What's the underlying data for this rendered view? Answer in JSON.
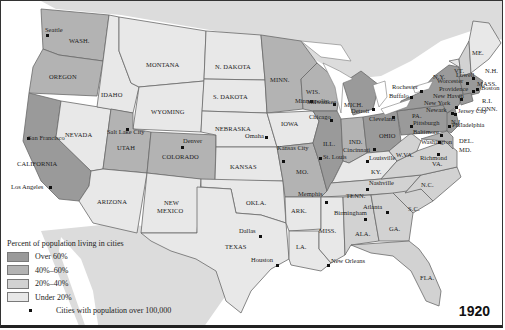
{
  "map": {
    "year": "1920",
    "colors": {
      "over60": "#9a9a9a",
      "40to60": "#b3b3b3",
      "20to40": "#d2d2d2",
      "under20": "#e8e8e8",
      "water": "#ffffff",
      "outside": "#d9d9d9"
    },
    "legend": {
      "title": "Percent of population living in cities",
      "items": [
        {
          "label": "Over 60%",
          "key": "over60"
        },
        {
          "label": "40%–60%",
          "key": "40to60"
        },
        {
          "label": "20%–40%",
          "key": "20to40"
        },
        {
          "label": "Under 20%",
          "key": "under20"
        }
      ],
      "cities_label": "Cities with population over 100,000"
    },
    "states": [
      {
        "name": "WASH.",
        "x": 68,
        "y": 36
      },
      {
        "name": "OREGON",
        "x": 48,
        "y": 72
      },
      {
        "name": "CALIFORNIA",
        "x": 16,
        "y": 159
      },
      {
        "name": "NEVADA",
        "x": 64,
        "y": 130
      },
      {
        "name": "IDAHO",
        "x": 100,
        "y": 90
      },
      {
        "name": "MONTANA",
        "x": 145,
        "y": 60
      },
      {
        "name": "WYOMING",
        "x": 150,
        "y": 107
      },
      {
        "name": "UTAH",
        "x": 116,
        "y": 143
      },
      {
        "name": "COLORADO",
        "x": 161,
        "y": 152
      },
      {
        "name": "ARIZONA",
        "x": 96,
        "y": 197
      },
      {
        "name": "NEW",
        "x": 163,
        "y": 198
      },
      {
        "name": "MEXICO",
        "x": 156,
        "y": 206
      },
      {
        "name": "N. DAKOTA",
        "x": 214,
        "y": 62
      },
      {
        "name": "S. DAKOTA",
        "x": 212,
        "y": 92
      },
      {
        "name": "NEBRASKA",
        "x": 214,
        "y": 124
      },
      {
        "name": "KANSAS",
        "x": 229,
        "y": 162
      },
      {
        "name": "OKLA.",
        "x": 245,
        "y": 198
      },
      {
        "name": "TEXAS",
        "x": 224,
        "y": 242
      },
      {
        "name": "MINN.",
        "x": 269,
        "y": 75
      },
      {
        "name": "IOWA",
        "x": 280,
        "y": 119
      },
      {
        "name": "MO.",
        "x": 295,
        "y": 167
      },
      {
        "name": "ARK.",
        "x": 290,
        "y": 206
      },
      {
        "name": "LA.",
        "x": 295,
        "y": 242
      },
      {
        "name": "WIS.",
        "x": 305,
        "y": 87
      },
      {
        "name": "ILL.",
        "x": 322,
        "y": 139
      },
      {
        "name": "MICH.",
        "x": 343,
        "y": 100
      },
      {
        "name": "IND.",
        "x": 348,
        "y": 137
      },
      {
        "name": "OHIO",
        "x": 378,
        "y": 131
      },
      {
        "name": "KY.",
        "x": 370,
        "y": 167
      },
      {
        "name": "TENN.",
        "x": 345,
        "y": 191
      },
      {
        "name": "MISS.",
        "x": 318,
        "y": 226
      },
      {
        "name": "ALA.",
        "x": 354,
        "y": 229
      },
      {
        "name": "GA.",
        "x": 388,
        "y": 224
      },
      {
        "name": "FLA.",
        "x": 419,
        "y": 273
      },
      {
        "name": "S.C.",
        "x": 407,
        "y": 204
      },
      {
        "name": "N.C.",
        "x": 420,
        "y": 180
      },
      {
        "name": "VA.",
        "x": 431,
        "y": 159
      },
      {
        "name": "W.VA.",
        "x": 395,
        "y": 150
      },
      {
        "name": "MD.",
        "x": 458,
        "y": 145
      },
      {
        "name": "DEL.",
        "x": 458,
        "y": 136
      },
      {
        "name": "PA.",
        "x": 411,
        "y": 111
      },
      {
        "name": "N.J.",
        "x": 450,
        "y": 117
      },
      {
        "name": "N.Y.",
        "x": 432,
        "y": 72
      },
      {
        "name": "VT.",
        "x": 453,
        "y": 66
      },
      {
        "name": "N.H.",
        "x": 484,
        "y": 66
      },
      {
        "name": "ME.",
        "x": 471,
        "y": 48
      },
      {
        "name": "MASS.",
        "x": 476,
        "y": 79
      },
      {
        "name": "R.I.",
        "x": 481,
        "y": 96
      },
      {
        "name": "CONN.",
        "x": 476,
        "y": 104
      }
    ],
    "cities": [
      {
        "name": "Seattle",
        "dx": 46,
        "dy": 34,
        "lx": 44,
        "ly": 29
      },
      {
        "name": "San Francisco",
        "dx": 27,
        "dy": 137,
        "lx": 27,
        "ly": 137
      },
      {
        "name": "Los Angeles",
        "dx": 49,
        "dy": 186,
        "lx": 10,
        "ly": 186
      },
      {
        "name": "Salt Lake City",
        "dx": 126,
        "dy": 128,
        "lx": 106,
        "ly": 131
      },
      {
        "name": "Denver",
        "dx": 181,
        "dy": 146,
        "lx": 182,
        "ly": 140
      },
      {
        "name": "Minneapolis",
        "dx": 310,
        "dy": 100,
        "lx": 294,
        "ly": 100
      },
      {
        "name": "Omaha",
        "dx": 265,
        "dy": 136,
        "lx": 244,
        "ly": 135
      },
      {
        "name": "Kansas City",
        "dx": 282,
        "dy": 160,
        "lx": 276,
        "ly": 147
      },
      {
        "name": "Milwaukee",
        "dx": 333,
        "dy": 103,
        "lx": 306,
        "ly": 101
      },
      {
        "name": "Chicago",
        "dx": 330,
        "dy": 119,
        "lx": 308,
        "ly": 116
      },
      {
        "name": "Detroit",
        "dx": 372,
        "dy": 108,
        "lx": 350,
        "ly": 110
      },
      {
        "name": "Cleveland",
        "dx": 392,
        "dy": 116,
        "lx": 368,
        "ly": 118
      },
      {
        "name": "St. Louis",
        "dx": 319,
        "dy": 157,
        "lx": 322,
        "ly": 156
      },
      {
        "name": "Cincinnati",
        "dx": 373,
        "dy": 148,
        "lx": 342,
        "ly": 149
      },
      {
        "name": "Louisville",
        "dx": 366,
        "dy": 160,
        "lx": 368,
        "ly": 157
      },
      {
        "name": "Memphis",
        "dx": 325,
        "dy": 201,
        "lx": 297,
        "ly": 193
      },
      {
        "name": "Nashville",
        "dx": 366,
        "dy": 188,
        "lx": 368,
        "ly": 182
      },
      {
        "name": "Birmingham",
        "dx": 364,
        "dy": 218,
        "lx": 333,
        "ly": 212
      },
      {
        "name": "Atlanta",
        "dx": 386,
        "dy": 211,
        "lx": 362,
        "ly": 206
      },
      {
        "name": "Dallas",
        "dx": 259,
        "dy": 235,
        "lx": 238,
        "ly": 230
      },
      {
        "name": "Houston",
        "dx": 276,
        "dy": 264,
        "lx": 250,
        "ly": 259
      },
      {
        "name": "New Orleans",
        "dx": 327,
        "dy": 264,
        "lx": 330,
        "ly": 260
      },
      {
        "name": "Richmond",
        "dx": 437,
        "dy": 153,
        "lx": 419,
        "ly": 157
      },
      {
        "name": "Washington",
        "dx": 438,
        "dy": 141,
        "lx": 420,
        "ly": 141
      },
      {
        "name": "Baltimore",
        "dx": 440,
        "dy": 134,
        "lx": 412,
        "ly": 131
      },
      {
        "name": "Pittsburgh",
        "dx": 410,
        "dy": 125,
        "lx": 412,
        "ly": 122
      },
      {
        "name": "Philadelphia",
        "dx": 448,
        "dy": 125,
        "lx": 451,
        "ly": 124
      },
      {
        "name": "Buffalo",
        "dx": 410,
        "dy": 96,
        "lx": 388,
        "ly": 95
      },
      {
        "name": "Rochester",
        "dx": 420,
        "dy": 90,
        "lx": 391,
        "ly": 86
      },
      {
        "name": "Newark",
        "dx": 451,
        "dy": 112,
        "lx": 425,
        "ly": 109
      },
      {
        "name": "Jersey City",
        "dx": 454,
        "dy": 113,
        "lx": 457,
        "ly": 110
      },
      {
        "name": "New York",
        "dx": 455,
        "dy": 106,
        "lx": 423,
        "ly": 102
      },
      {
        "name": "New Haven",
        "dx": 460,
        "dy": 98,
        "lx": 432,
        "ly": 95
      },
      {
        "name": "Providence",
        "dx": 472,
        "dy": 90,
        "lx": 438,
        "ly": 88
      },
      {
        "name": "Worcester",
        "dx": 466,
        "dy": 82,
        "lx": 436,
        "ly": 80
      },
      {
        "name": "Lowell",
        "dx": 472,
        "dy": 77,
        "lx": 455,
        "ly": 74
      },
      {
        "name": "Boston",
        "dx": 476,
        "dy": 88,
        "lx": 480,
        "ly": 87
      }
    ]
  }
}
